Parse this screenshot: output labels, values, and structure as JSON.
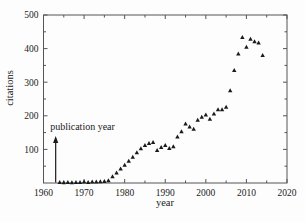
{
  "figure": {
    "xlabel": "year",
    "ylabel": "citations"
  },
  "chart_data": {
    "type": "scatter",
    "marker": {
      "shape": "triangle-up",
      "color": "#1a1a1a",
      "size": 4
    },
    "frame_color": "#555555",
    "text_color": "#222222",
    "xlabel": "year",
    "ylabel": "citations",
    "xlim": [
      1960,
      2020
    ],
    "ylim": [
      0,
      500
    ],
    "x_major_ticks": [
      1960,
      1970,
      1980,
      1990,
      2000,
      2010,
      2020
    ],
    "x_minor_ticks": [
      1965,
      1975,
      1985,
      1995,
      2005,
      2015
    ],
    "y_major_ticks": [
      100,
      200,
      300,
      400,
      500
    ],
    "y_minor_ticks": [
      50,
      150,
      250,
      350,
      450
    ],
    "grid": false,
    "legend": null,
    "annotation": {
      "text": "publication year",
      "arrow_year": 1963,
      "arrow_from": 0,
      "arrow_to": 140
    },
    "series": [
      {
        "name": "citations per year",
        "points": [
          [
            1964,
            2
          ],
          [
            1965,
            1
          ],
          [
            1966,
            2
          ],
          [
            1967,
            1
          ],
          [
            1968,
            2
          ],
          [
            1969,
            2
          ],
          [
            1970,
            3
          ],
          [
            1971,
            2
          ],
          [
            1972,
            3
          ],
          [
            1973,
            3
          ],
          [
            1974,
            4
          ],
          [
            1975,
            5
          ],
          [
            1976,
            7
          ],
          [
            1977,
            19
          ],
          [
            1978,
            30
          ],
          [
            1979,
            42
          ],
          [
            1980,
            53
          ],
          [
            1981,
            65
          ],
          [
            1982,
            77
          ],
          [
            1983,
            90
          ],
          [
            1984,
            102
          ],
          [
            1985,
            112
          ],
          [
            1986,
            118
          ],
          [
            1987,
            121
          ],
          [
            1988,
            97
          ],
          [
            1989,
            106
          ],
          [
            1990,
            112
          ],
          [
            1991,
            103
          ],
          [
            1992,
            108
          ],
          [
            1993,
            137
          ],
          [
            1994,
            153
          ],
          [
            1995,
            176
          ],
          [
            1996,
            167
          ],
          [
            1997,
            160
          ],
          [
            1998,
            187
          ],
          [
            1999,
            196
          ],
          [
            2000,
            203
          ],
          [
            2001,
            190
          ],
          [
            2002,
            206
          ],
          [
            2003,
            218
          ],
          [
            2004,
            218
          ],
          [
            2005,
            226
          ],
          [
            2006,
            275
          ],
          [
            2007,
            335
          ],
          [
            2008,
            384
          ],
          [
            2009,
            433
          ],
          [
            2010,
            404
          ],
          [
            2011,
            428
          ],
          [
            2012,
            421
          ],
          [
            2013,
            417
          ],
          [
            2014,
            380
          ]
        ]
      }
    ]
  }
}
